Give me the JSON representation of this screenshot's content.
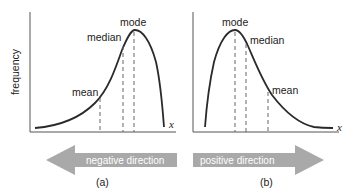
{
  "diagram": {
    "y_axis_label": "frequency",
    "x_axis_label": "x",
    "colors": {
      "curve": "#2a2a2a",
      "axis": "#555555",
      "dashed": "#666666",
      "arrow_fill": "#a9a9a9",
      "arrow_text": "#ffffff"
    },
    "panels": [
      {
        "caption": "(a)",
        "skew": "negative",
        "labels": {
          "mode": "mode",
          "median": "median",
          "mean": "mean"
        },
        "order_left_to_right": [
          "mean",
          "median",
          "mode"
        ],
        "arrow": {
          "direction": "left",
          "text": "negative direction"
        }
      },
      {
        "caption": "(b)",
        "skew": "positive",
        "labels": {
          "mode": "mode",
          "median": "median",
          "mean": "mean"
        },
        "order_left_to_right": [
          "mode",
          "median",
          "mean"
        ],
        "arrow": {
          "direction": "right",
          "text": "positive direction"
        }
      }
    ]
  }
}
